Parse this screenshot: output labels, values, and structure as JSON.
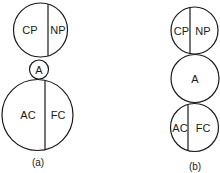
{
  "diagram_a": {
    "caption": "(a)",
    "top_circle": {
      "left_label": "CP",
      "right_label": "NP"
    },
    "middle_circle": {
      "label": "A"
    },
    "bottom_circle": {
      "left_label": "AC",
      "right_label": "FC"
    }
  },
  "diagram_b": {
    "caption": "(b)",
    "top_circle": {
      "left_label": "CP",
      "right_label": "NP"
    },
    "middle_circle": {
      "label": "A"
    },
    "bottom_circle": {
      "left_label": "AC",
      "right_label": "FC"
    }
  },
  "colors": {
    "stroke": "#1a1a1a",
    "background": "#ffffff"
  }
}
